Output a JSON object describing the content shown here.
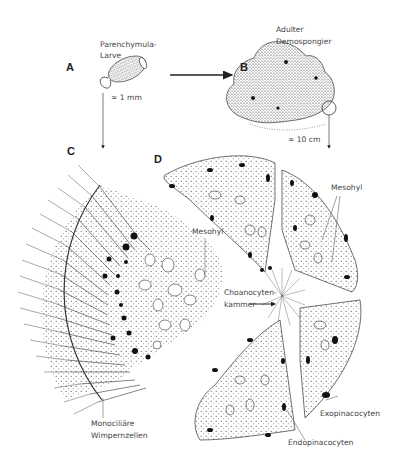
{
  "panels": {
    "A": {
      "letter": "A",
      "title_line1": "Parenchymula-",
      "title_line2": "Larve",
      "scale": "≈ 1 mm"
    },
    "B": {
      "letter": "B",
      "title_line1": "Adulter",
      "title_line2": "Demospongier",
      "scale": "≈ 10 cm"
    },
    "C": {
      "letter": "C",
      "labels": {
        "mesohyl": "Mesohyl",
        "cells_line1": "Monociliäre",
        "cells_line2": "Wimpernzellen"
      }
    },
    "D": {
      "letter": "D",
      "labels": {
        "mesohyl": "Mesohyl",
        "chamber_line1": "Choanocyten-",
        "chamber_line2": "kammer",
        "exo": "Exopinacocyten",
        "endo": "Endopinacocyten"
      }
    }
  },
  "colors": {
    "line": "#222222",
    "label": "#444444",
    "background": "#ffffff"
  }
}
